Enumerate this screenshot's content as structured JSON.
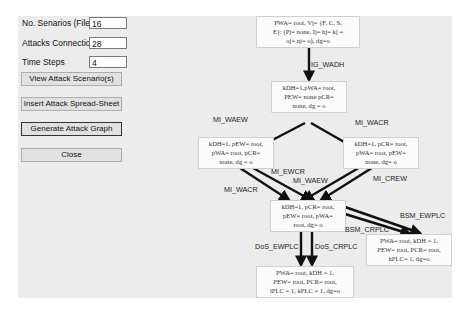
{
  "form": {
    "fields": [
      {
        "label": "No. Senarios (Files)",
        "value": "16"
      },
      {
        "label": "Attacks Connections",
        "value": "28"
      },
      {
        "label": "Time Steps",
        "value": "4"
      }
    ],
    "buttons": {
      "view": "View Attack Scenario(s)",
      "insert": "Insert Attack Spread-Sheet",
      "generate": "Generate Attack Graph",
      "close": "Close"
    }
  },
  "graph": {
    "nodes": {
      "n0": [
        "PWA= root, Vj= {F, C, S,",
        "E}: (Pj= none, Ij= hj= kj =",
        "oj= nj= o), dg=o"
      ],
      "n1": [
        "kDH=1,pWA= root,",
        "PEW= none pCR=",
        "none, dg = o"
      ],
      "n2": [
        "kDH=1, pEW= root,",
        "pWA= root, pCR=",
        "none, dg = o"
      ],
      "n3": [
        "kDH=1, pCR= root,",
        "pWA= root, pEW=",
        "none, dg= o"
      ],
      "n4": [
        "kDH=1, pCR= root,",
        "pEW= root, pWA=",
        "root, dg= o"
      ],
      "n5": [
        "PWA= root, kDH = 1,",
        "PEW= root, PCR= root,",
        "hPLC= 1, dg=o"
      ],
      "n6": [
        "PWA= root, kDH = 1,",
        "PEW= root, PCR= root,",
        "lPLC = 1, kPLC = 1, dg=o"
      ]
    },
    "edges": {
      "e_wadh": "IG_WADH",
      "e_waew": "MI_WAEW",
      "e_wacr": "MI_WACR",
      "e_ewcr": "MI_EWCR",
      "e_waew2": "MI_WAEW",
      "e_wacr2": "MI_WACR",
      "e_crew": "MI_CREW",
      "e_bsm_ew": "BSM_EWPLC",
      "e_bsm_cr": "BSM_CRPLC",
      "e_dos_ew": "DoS_EWPLC",
      "e_dos_cr": "DoS_CRPLC"
    }
  }
}
